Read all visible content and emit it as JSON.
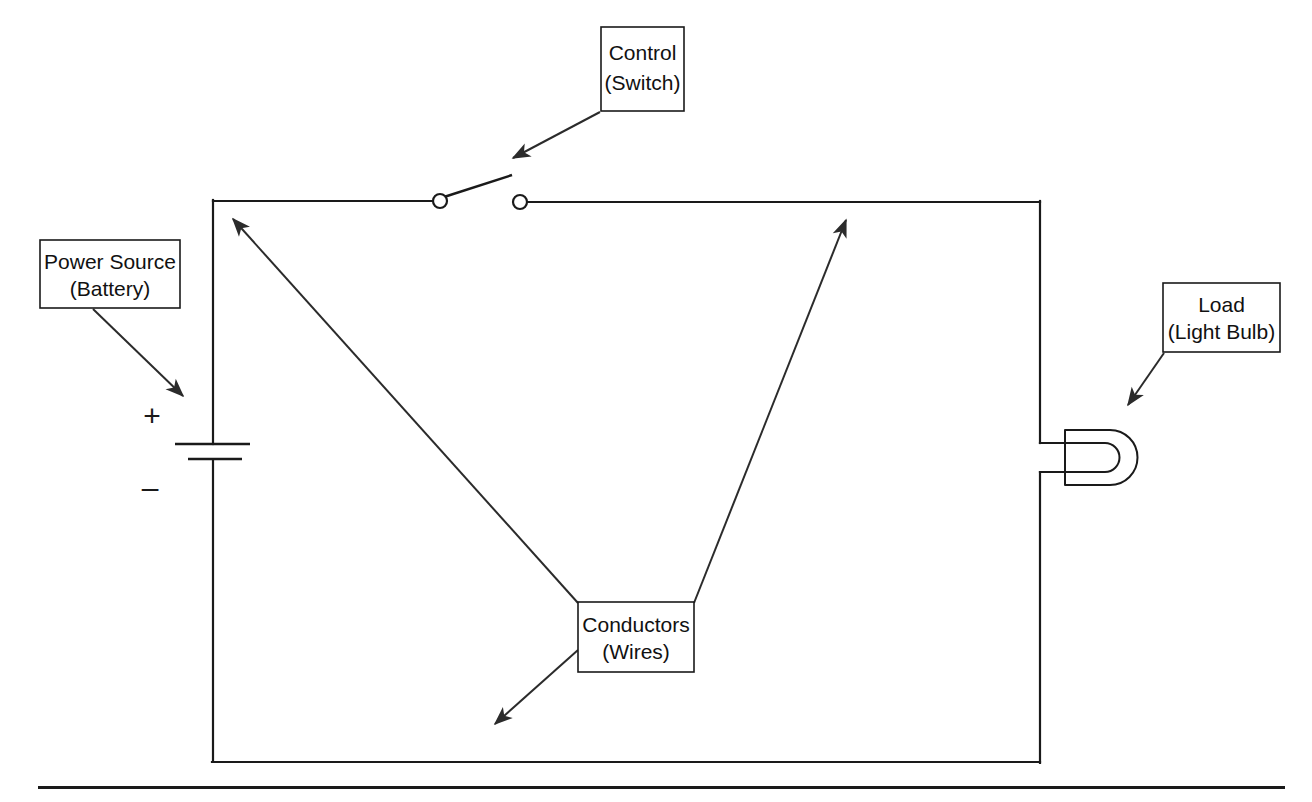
{
  "diagram": {
    "background_color": "#ffffff",
    "line_color": "#1a1a1a",
    "callouts": [
      {
        "id": "control",
        "line1": "Control",
        "line2": "(Switch)",
        "box": {
          "x": 601,
          "y": 27,
          "w": 83,
          "h": 84
        },
        "arrow": {
          "x1": 600,
          "y1": 112,
          "x2": 513,
          "y2": 158
        }
      },
      {
        "id": "power-source",
        "line1": "Power Source",
        "line2": "(Battery)",
        "box": {
          "x": 40,
          "y": 240,
          "w": 140,
          "h": 68
        },
        "arrow": {
          "x1": 93,
          "y1": 309,
          "x2": 183,
          "y2": 396
        }
      },
      {
        "id": "load",
        "line1": "Load",
        "line2": "(Light Bulb)",
        "box": {
          "x": 1163,
          "y": 283,
          "w": 117,
          "h": 69
        },
        "arrow": {
          "x1": 1164,
          "y1": 353,
          "x2": 1128,
          "y2": 405
        }
      },
      {
        "id": "conductors",
        "line1": "Conductors",
        "line2": "(Wires)",
        "box": {
          "x": 578,
          "y": 602,
          "w": 116,
          "h": 70
        },
        "arrows": [
          {
            "x1": 578,
            "y1": 603,
            "x2": 233,
            "y2": 219
          },
          {
            "x1": 694,
            "y1": 603,
            "x2": 846,
            "y2": 220
          },
          {
            "x1": 578,
            "y1": 650,
            "x2": 495,
            "y2": 724
          }
        ]
      }
    ],
    "circuit": {
      "loop": {
        "left_x": 213,
        "right_x": 1040,
        "top_y": 201,
        "bottom_y": 762
      },
      "battery": {
        "long_plate": {
          "x1": 175,
          "x2": 250,
          "y": 444
        },
        "short_plate": {
          "x1": 188,
          "x2": 242,
          "y": 459
        },
        "plus_sign": "+",
        "plus_pos": {
          "x": 152,
          "y": 418
        },
        "minus_sign": "–",
        "minus_pos": {
          "x": 150,
          "y": 490
        }
      },
      "switch": {
        "left_terminal": {
          "cx": 440,
          "cy": 201,
          "r": 7
        },
        "right_terminal": {
          "cx": 520,
          "cy": 202,
          "r": 7
        },
        "lever": {
          "x1": 444,
          "y1": 197,
          "x2": 512,
          "y2": 175
        },
        "state": "open"
      },
      "bulb": {
        "outer_top_y": 430,
        "outer_bottom_y": 485,
        "outer_left_x": 1065,
        "outer_right_x": 1138,
        "lead_top_y": 443,
        "lead_bottom_y": 472,
        "filament_left_x": 1092,
        "filament_right_x": 1120
      }
    },
    "footer_rule": {
      "x": 38,
      "y": 786,
      "w": 1247,
      "h": 3
    }
  }
}
